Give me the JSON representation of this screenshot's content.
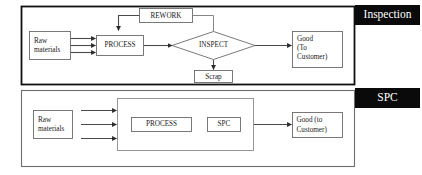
{
  "diagram": {
    "colors": {
      "banner_background": "#0a0a0a",
      "banner_text": "#ffffff",
      "panel_border_top": "#111111",
      "panel_border_bottom": "#6e6e6e",
      "box_border": "#6b6b6b",
      "connector": "#4a4a4a",
      "page_background": "#ffffff"
    },
    "panels": [
      {
        "id": "inspection",
        "banner_label": "Inspection",
        "nodes": [
          {
            "id": "raw-materials",
            "label": "Raw\nmaterials",
            "line1": "Raw",
            "line2": "materials",
            "shape": "rect"
          },
          {
            "id": "process",
            "label": "PROCESS",
            "shape": "rect"
          },
          {
            "id": "rework",
            "label": "REWORK",
            "shape": "rect"
          },
          {
            "id": "inspect",
            "label": "INSPECT",
            "shape": "diamond"
          },
          {
            "id": "scrap",
            "label": "Scrap",
            "shape": "rect"
          },
          {
            "id": "good-to-customer",
            "label": "Good\n(To\nCustomer)",
            "line1": "Good",
            "line2": "(To",
            "line3": "Customer)",
            "shape": "rect"
          }
        ],
        "edges": [
          {
            "from": "raw-materials",
            "to": "process",
            "arrow": true
          },
          {
            "from": "raw-materials",
            "to": "process",
            "arrow": true
          },
          {
            "from": "raw-materials",
            "to": "process",
            "arrow": true
          },
          {
            "from": "process",
            "to": "inspect",
            "arrow": true
          },
          {
            "from": "inspect",
            "to": "rework",
            "arrow": false
          },
          {
            "from": "rework",
            "to": "process",
            "arrow": true
          },
          {
            "from": "inspect",
            "to": "scrap",
            "arrow": true
          },
          {
            "from": "inspect",
            "to": "good-to-customer",
            "arrow": true
          }
        ]
      },
      {
        "id": "spc",
        "banner_label": "SPC",
        "nodes": [
          {
            "id": "raw-materials-2",
            "label": "Raw\nmaterials",
            "line1": "Raw",
            "line2": "materials",
            "shape": "rect"
          },
          {
            "id": "process-container",
            "label": "",
            "shape": "rect"
          },
          {
            "id": "process-2",
            "label": "PROCESS",
            "shape": "rect"
          },
          {
            "id": "spc-node",
            "label": "SPC",
            "shape": "rect"
          },
          {
            "id": "good-to-customer-2",
            "label": "Good (to\nCustomer)",
            "line1": "Good (to",
            "line2": "Customer)",
            "shape": "rect"
          }
        ],
        "edges": [
          {
            "from": "raw-materials-2",
            "to": "process-container",
            "arrow": true
          },
          {
            "from": "raw-materials-2",
            "to": "process-container",
            "arrow": true
          },
          {
            "from": "raw-materials-2",
            "to": "process-container",
            "arrow": true
          },
          {
            "from": "process-container",
            "to": "good-to-customer-2",
            "arrow": true
          }
        ]
      }
    ]
  }
}
